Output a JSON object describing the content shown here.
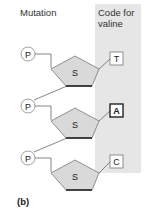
{
  "headers": {
    "mutation": "Mutation",
    "code_for_valine": "Code for valine"
  },
  "figure_label": "(b)",
  "nucleotides": [
    {
      "phosphate": "P",
      "sugar": "S",
      "base": "T",
      "highlighted": false
    },
    {
      "phosphate": "P",
      "sugar": "S",
      "base": "A",
      "highlighted": true
    },
    {
      "phosphate": "P",
      "sugar": "S",
      "base": "C",
      "highlighted": false
    }
  ],
  "colors": {
    "panel": "#e6e6e6",
    "sugar_fill": "#d9d9d9",
    "stroke": "#555555"
  }
}
